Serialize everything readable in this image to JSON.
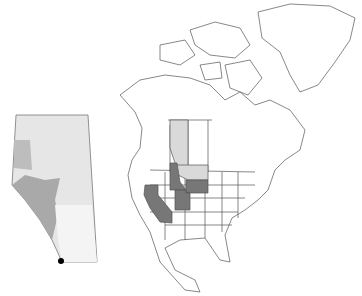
{
  "map": {
    "title": "",
    "regions_highlighted": [
      {
        "name": "Alberta",
        "shade": "light",
        "color": "#d9d9d9"
      },
      {
        "name": "Montana",
        "shade": "light",
        "color": "#d9d9d9"
      },
      {
        "name": "Idaho",
        "shade": "dark",
        "color": "#777777"
      },
      {
        "name": "Wyoming",
        "shade": "dark",
        "color": "#777777"
      },
      {
        "name": "Utah",
        "shade": "dark",
        "color": "#777777"
      },
      {
        "name": "California",
        "shade": "dark",
        "color": "#777777"
      }
    ],
    "inset": {
      "region": "Alberta",
      "marker": {
        "shape": "dot",
        "color": "#000000",
        "location": "southwest corner"
      }
    },
    "colors": {
      "outline": "#555555",
      "land": "#ffffff",
      "light_fill": "#d9d9d9",
      "dark_fill": "#777777"
    }
  }
}
